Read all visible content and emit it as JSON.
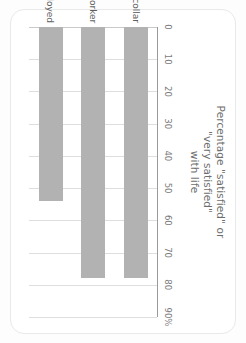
{
  "card": {
    "background": "#ffffff",
    "border_color": "#e9e9e9"
  },
  "chart_data": {
    "type": "bar",
    "orientation": "horizontal",
    "title": "Percentage \"satisfied\" or\n\"very satisfied\"\nwith life",
    "categories": [
      "White collar",
      "Manual worker",
      "Unemployed"
    ],
    "values": [
      78,
      78,
      54
    ],
    "series": [
      {
        "name": "Percentage satisfied or very satisfied with life",
        "values": [
          78,
          78,
          54
        ]
      }
    ],
    "xlabel": "",
    "ylabel": "",
    "xlim": [
      0,
      90
    ],
    "ticks": [
      "0",
      "10",
      "20",
      "30",
      "40",
      "50",
      "60",
      "70",
      "80",
      "90%"
    ],
    "tick_values": [
      0,
      10,
      20,
      30,
      40,
      50,
      60,
      70,
      80,
      90
    ],
    "grid": true,
    "legend": "none",
    "bar_color": "#b2b2b2",
    "grid_color": "#dedede",
    "axis_color": "#9a9a9a",
    "text_color": "#6d6d6d",
    "rotation_degrees": 90
  }
}
